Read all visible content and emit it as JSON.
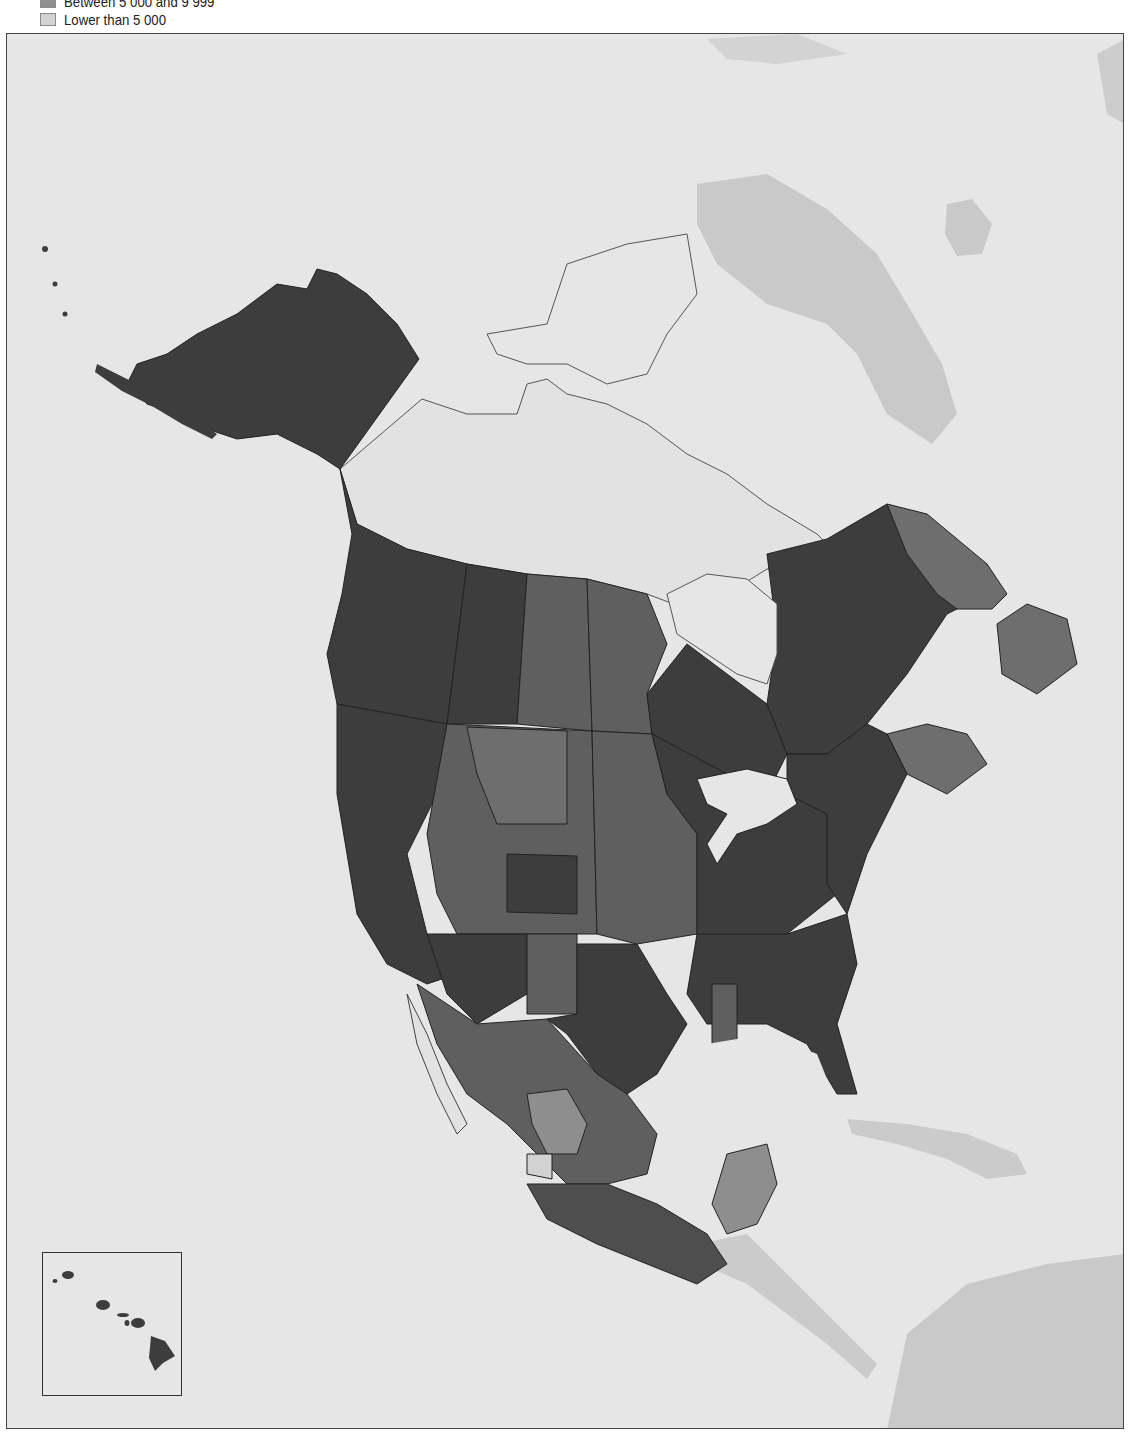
{
  "legend": {
    "items": [
      {
        "label": "Between 5 000 and 9 999",
        "color": "#8e8e8e"
      },
      {
        "label": "Lower than 5 000",
        "color": "#d2d2d2"
      }
    ]
  },
  "palette": {
    "class_1_darkest": "#3d3d3d",
    "class_2": "#4e4e4e",
    "class_3": "#5f5f5f",
    "class_4": "#6e6e6e",
    "class_5": "#8e8e8e",
    "class_6_lightest": "#d2d2d2",
    "no_data_land": "#e2e2e2",
    "ocean": "#e6e6e6",
    "other_land": "#c9c9c9",
    "border": "#222222"
  },
  "inset": {
    "name": "hawaii-inset"
  }
}
